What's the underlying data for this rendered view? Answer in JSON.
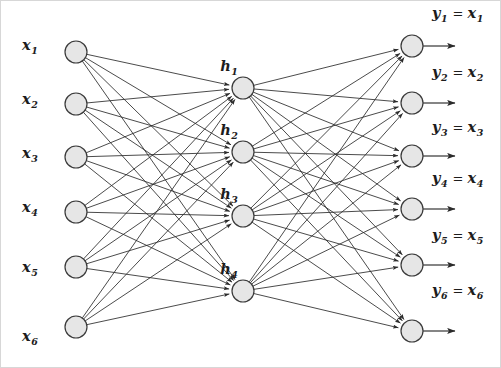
{
  "diagram": {
    "type": "neural-network",
    "background_color": "#ffffff",
    "node_fill_color": "#e6e6e6",
    "node_stroke_color": "#3a3a3a",
    "edge_color": "#2b2b2b",
    "canvas": {
      "width": 501,
      "height": 368
    }
  },
  "layers": {
    "input": {
      "name": "input-layer",
      "count": 6,
      "node_x": 76,
      "node_radius": 11,
      "label_x": 30,
      "nodes": [
        {
          "id": "x1",
          "base": "x",
          "sub": "1",
          "cy": 52,
          "label_y": 50
        },
        {
          "id": "x2",
          "base": "x",
          "sub": "2",
          "cy": 104,
          "label_y": 104
        },
        {
          "id": "x3",
          "base": "x",
          "sub": "3",
          "cy": 157,
          "label_y": 158
        },
        {
          "id": "x4",
          "base": "x",
          "sub": "4",
          "cy": 212,
          "label_y": 212
        },
        {
          "id": "x5",
          "base": "x",
          "sub": "5",
          "cy": 267,
          "label_y": 272
        },
        {
          "id": "x6",
          "base": "x",
          "sub": "6",
          "cy": 327,
          "label_y": 341
        }
      ]
    },
    "hidden": {
      "name": "hidden-layer",
      "count": 4,
      "node_x": 243,
      "node_radius": 11,
      "label_dx": -14,
      "label_dy": -17,
      "nodes": [
        {
          "id": "h1",
          "base": "h",
          "sub": "1",
          "cy": 88
        },
        {
          "id": "h2",
          "base": "h",
          "sub": "2",
          "cy": 152
        },
        {
          "id": "h3",
          "base": "h",
          "sub": "3",
          "cy": 216
        },
        {
          "id": "h4",
          "base": "h",
          "sub": "4",
          "cy": 291
        }
      ]
    },
    "output": {
      "name": "output-layer",
      "count": 6,
      "node_x": 412,
      "node_radius": 11,
      "arrow_end_x": 455,
      "label_x": 432,
      "equals": "=",
      "nodes": [
        {
          "id": "y1",
          "base": "y",
          "sub": "1",
          "eq_base": "x",
          "eq_sub": "1",
          "cy": 46,
          "label_y": 18
        },
        {
          "id": "y2",
          "base": "y",
          "sub": "2",
          "eq_base": "x",
          "eq_sub": "2",
          "cy": 103,
          "label_y": 77
        },
        {
          "id": "y3",
          "base": "y",
          "sub": "3",
          "eq_base": "x",
          "eq_sub": "3",
          "cy": 156,
          "label_y": 132
        },
        {
          "id": "y4",
          "base": "y",
          "sub": "4",
          "eq_base": "x",
          "eq_sub": "4",
          "cy": 209,
          "label_y": 183
        },
        {
          "id": "y5",
          "base": "y",
          "sub": "5",
          "eq_base": "x",
          "eq_sub": "5",
          "cy": 265,
          "label_y": 240
        },
        {
          "id": "y6",
          "base": "y",
          "sub": "6",
          "eq_base": "x",
          "eq_sub": "6",
          "cy": 331,
          "label_y": 295
        }
      ]
    }
  },
  "connections": {
    "input_to_hidden": "fully-connected",
    "hidden_to_output": "fully-connected",
    "arrowheads": true
  }
}
